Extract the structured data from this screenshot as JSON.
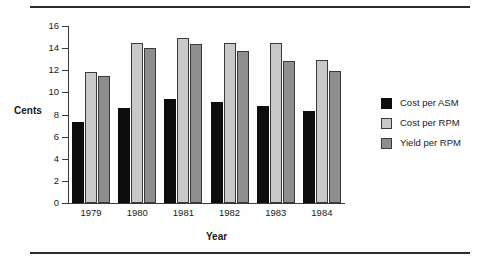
{
  "chart_data": {
    "type": "bar",
    "title": "",
    "xlabel": "Year",
    "ylabel": "Cents",
    "categories": [
      "1979",
      "1980",
      "1981",
      "1982",
      "1983",
      "1984"
    ],
    "series": [
      {
        "name": "Cost per ASM",
        "color": "#0d0d0d",
        "values": [
          7.3,
          8.6,
          9.4,
          9.1,
          8.8,
          8.3
        ]
      },
      {
        "name": "Cost per RPM",
        "color": "#c9c9c9",
        "values": [
          11.8,
          14.5,
          14.9,
          14.5,
          14.5,
          12.9
        ]
      },
      {
        "name": "Yield per RPM",
        "color": "#8e8e8e",
        "values": [
          11.5,
          14.0,
          14.4,
          13.7,
          12.8,
          11.9
        ]
      }
    ],
    "ylim": [
      0,
      16
    ],
    "yticks": [
      0,
      2,
      4,
      6,
      8,
      10,
      12,
      14,
      16
    ],
    "ytick_labels": [
      "0",
      "2",
      "4",
      "6",
      "8",
      "10",
      "12",
      "14",
      "16"
    ],
    "grid": false,
    "legend_position": "right"
  },
  "legend": {
    "items": [
      {
        "label": "Cost per ASM"
      },
      {
        "label": "Cost per RPM"
      },
      {
        "label": "Yield per RPM"
      }
    ]
  }
}
